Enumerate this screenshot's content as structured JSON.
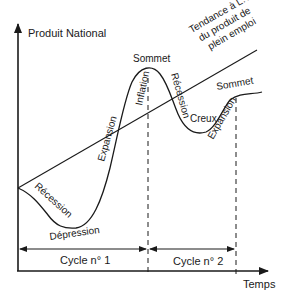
{
  "diagram": {
    "y_axis_label": "Produit National",
    "x_axis_label": "Temps",
    "trend_label": {
      "line1": "Tendance à L.T",
      "line2": "du produit de",
      "line3": "plein emploi"
    },
    "phases": {
      "recession_1": "Récession",
      "depression": "Dépression",
      "expansion_1": "Expansion",
      "inflation": "Inflation",
      "sommet_1": "Sommet",
      "recession_2": "Récession",
      "creux": "Creux",
      "expansion_2": "Expansion",
      "sommet_2": "Sommet"
    },
    "cycles": [
      {
        "label": "Cycle n° 1"
      },
      {
        "label": "Cycle n° 2"
      }
    ],
    "colors": {
      "ink": "#1a1a1a",
      "background": "#ffffff"
    }
  }
}
